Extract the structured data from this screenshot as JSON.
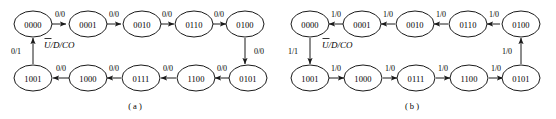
{
  "figure": {
    "type": "state-transition-diagram",
    "diagrams": [
      {
        "id": "a",
        "caption": "( a )",
        "control_label": "U/D/CO",
        "control_label_overbar_on": "U",
        "top_row_states": [
          "0000",
          "0001",
          "0010",
          "0110",
          "0100"
        ],
        "bottom_row_states": [
          "1001",
          "1000",
          "0111",
          "1100",
          "0101"
        ],
        "top_edge_labels": [
          "0/0",
          "0/0",
          "0/0",
          "0/0"
        ],
        "bottom_edge_labels": [
          "0/0",
          "0/0",
          "0/0",
          "0/0"
        ],
        "right_edge_label": "0/0",
        "left_edge_label": "0/1",
        "top_flow_direction": "left-to-right",
        "bottom_flow_direction": "right-to-left",
        "right_edge_direction": "down",
        "left_edge_direction": "up"
      },
      {
        "id": "b",
        "caption": "( b )",
        "control_label": "U/D/CO",
        "control_label_overbar_on": "U",
        "top_row_states": [
          "0000",
          "0001",
          "0010",
          "0110",
          "0100"
        ],
        "bottom_row_states": [
          "1001",
          "1000",
          "0111",
          "1100",
          "0101"
        ],
        "top_edge_labels": [
          "1/0",
          "1/0",
          "1/0",
          "1/0"
        ],
        "bottom_edge_labels": [
          "1/0",
          "1/0",
          "1/0",
          "1/0"
        ],
        "right_edge_label": "1/0",
        "left_edge_label": "1/1",
        "top_flow_direction": "right-to-left",
        "bottom_flow_direction": "left-to-right",
        "right_edge_direction": "up",
        "left_edge_direction": "down"
      }
    ],
    "colors": {
      "background": "#ffffff",
      "stroke": "#1a1a1a",
      "text": "#000000"
    }
  }
}
